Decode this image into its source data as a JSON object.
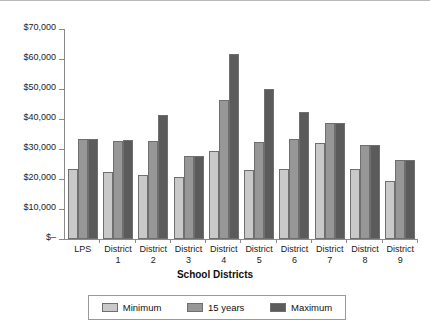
{
  "chart_data": {
    "type": "bar",
    "title": "",
    "xlabel": "School Districts",
    "ylabel": "",
    "ylim": [
      0,
      70000
    ],
    "ytick_values": [
      0,
      10000,
      20000,
      30000,
      40000,
      50000,
      60000,
      70000
    ],
    "ytick_labels": [
      "$–",
      "$10,000",
      "$20,000",
      "$30,000",
      "$40,000",
      "$50,000",
      "$60,000",
      "$70,000"
    ],
    "grid": false,
    "legend_position": "bottom",
    "categories": [
      "LPS",
      "District 1",
      "District 2",
      "District 3",
      "District 4",
      "District 5",
      "District 6",
      "District 7",
      "District 8",
      "District 9"
    ],
    "category_lines": [
      [
        "LPS",
        ""
      ],
      [
        "District",
        "1"
      ],
      [
        "District",
        "2"
      ],
      [
        "District",
        "3"
      ],
      [
        "District",
        "4"
      ],
      [
        "District",
        "5"
      ],
      [
        "District",
        "6"
      ],
      [
        "District",
        "7"
      ],
      [
        "District",
        "8"
      ],
      [
        "District",
        "9"
      ]
    ],
    "series": [
      {
        "name": "Minimum",
        "color": "#c9c9c9",
        "values": [
          23500,
          22200,
          21300,
          20800,
          29500,
          23000,
          23300,
          32000,
          23200,
          19300
        ]
      },
      {
        "name": "15 years",
        "color": "#979797",
        "values": [
          33200,
          32800,
          32800,
          27700,
          46500,
          32500,
          33200,
          38800,
          31200,
          26200
        ]
      },
      {
        "name": "Maximum",
        "color": "#5b5b5b",
        "values": [
          33400,
          33000,
          41300,
          27800,
          61800,
          50000,
          42200,
          38800,
          31300,
          26300
        ]
      }
    ]
  },
  "legend": {
    "items": [
      {
        "label": "Minimum"
      },
      {
        "label": "15 years"
      },
      {
        "label": "Maximum"
      }
    ]
  }
}
